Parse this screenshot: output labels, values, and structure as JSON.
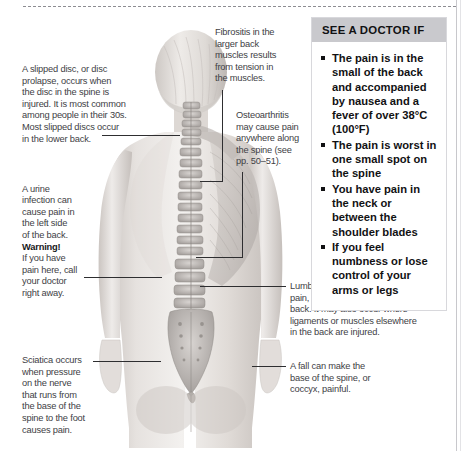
{
  "page": {
    "background_color": "#ffffff",
    "text_color": "#414145"
  },
  "figure": {
    "name": "back-anatomy-illustration",
    "skin_color": "#ded9d6",
    "bone_color": "#b9b4b1",
    "muscle_color": "#b0aaa6"
  },
  "annotations": [
    {
      "id": "slipped-disc",
      "text": "A slipped disc, or disc\nprolapse, occurs when\nthe disc in the spine is\ninjured. It is most common\namong people in their 30s.\nMost slipped discs occur\nin the lower back."
    },
    {
      "id": "urine-infection",
      "text_before": "A urine\ninfection can\ncause pain in\nthe left side\nof the back.",
      "warning_label": "Warning!",
      "text_after": "If you have\npain here, call\nyour doctor\nright away."
    },
    {
      "id": "sciatica",
      "text": "Sciatica occurs\nwhen pressure\non the nerve\nthat runs from\nthe base of the\nspine to the foot\ncauses pain."
    },
    {
      "id": "fibrositis",
      "text": "Fibrositis in the\nlarger back\nmuscles results\nfrom tension in\nthe muscles."
    },
    {
      "id": "osteoarthritis",
      "text": "Osteoarthritis\nmay cause pain\nanywhere along\nthe spine (see\npp. 50–51)."
    },
    {
      "id": "lumbago",
      "text": "Lumbago, or non-specific back\npain, commonly affects the lower\nback. It may also occur where\nligaments or muscles elsewhere\nin the back are injured."
    },
    {
      "id": "coccyx",
      "text": "A fall can make the\nbase of the spine, or\ncoccyx, painful."
    }
  ],
  "doctor_box": {
    "title": "SEE A DOCTOR IF",
    "header_color": "#c9c9cd",
    "items": [
      "The pain is in the small of the back and accompanied by nausea and a fever of over 38°C (100°F)",
      "The pain is worst in one small spot on the spine",
      "You have pain in the neck or between the shoulder blades",
      "If you feel numbness or lose control of your arms or legs"
    ]
  }
}
